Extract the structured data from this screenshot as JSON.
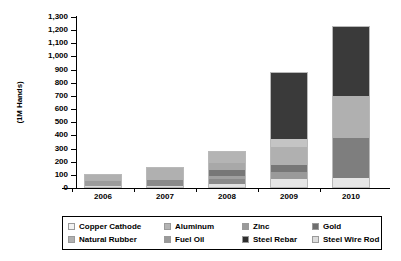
{
  "chart_data": {
    "type": "bar",
    "stacked": true,
    "title": "",
    "subtitle": "",
    "xlabel": "",
    "ylabel": "(1M Hands)",
    "categories": [
      "2006",
      "2007",
      "2008",
      "2009",
      "2010"
    ],
    "ylim": [
      0,
      1300
    ],
    "ytick_values": [
      0,
      100,
      200,
      300,
      400,
      500,
      600,
      700,
      800,
      900,
      1000,
      1100,
      1200,
      1300
    ],
    "ytick_labels": [
      "0",
      "100",
      "200",
      "300",
      "400",
      "500",
      "600",
      "700",
      "800",
      "900",
      "1,000",
      "1,100",
      "1,200",
      "1,300"
    ],
    "grid": false,
    "legend_position": "bottom",
    "series": [
      {
        "name": "Copper Cathode",
        "color": "#f2f2f2",
        "values": [
          8,
          10,
          15,
          25,
          40
        ]
      },
      {
        "name": "Aluminum",
        "color": "#b4b4b4",
        "values": [
          0,
          0,
          20,
          35,
          60
        ]
      },
      {
        "name": "Zinc",
        "color": "#8f8f8f",
        "values": [
          0,
          0,
          15,
          30,
          50
        ]
      },
      {
        "name": "Gold",
        "color": "#6e6e6e",
        "values": [
          0,
          0,
          20,
          40,
          70
        ]
      },
      {
        "name": "Natural Rubber",
        "color": "#9c9c9c",
        "values": [
          0,
          45,
          30,
          70,
          130
        ]
      },
      {
        "name": "Fuel Oil",
        "color": "#a8a8a8",
        "values": [
          0,
          0,
          35,
          80,
          140
        ]
      },
      {
        "name": "Steel Rebar",
        "color": "#3a3a3a",
        "values": [
          0,
          0,
          0,
          300,
          430
        ]
      },
      {
        "name": "Steel Wire Rod",
        "color": "#d0d0d0",
        "values": [
          102,
          105,
          145,
          300,
          310
        ]
      }
    ],
    "totals": [
      110,
      160,
      280,
      880,
      1230
    ],
    "bars": [
      {
        "category": "2006",
        "total": 110,
        "segments": [
          {
            "name": "Steel Wire Rod",
            "value": 8,
            "color": "#dcdcdc"
          },
          {
            "name": "Natural Rubber",
            "value": 45,
            "color": "#9c9c9c"
          },
          {
            "name": "Copper Cathode",
            "value": 57,
            "color": "#b0b0b0"
          }
        ]
      },
      {
        "category": "2007",
        "total": 160,
        "segments": [
          {
            "name": "Steel Wire Rod",
            "value": 10,
            "color": "#dcdcdc"
          },
          {
            "name": "Steel Rebar",
            "value": 45,
            "color": "#8a8a8a"
          },
          {
            "name": "Natural Rubber",
            "value": 105,
            "color": "#b0b0b0"
          }
        ]
      },
      {
        "category": "2008",
        "total": 280,
        "segments": [
          {
            "name": "Steel Wire Rod",
            "value": 20,
            "color": "#e2e2e2"
          },
          {
            "name": "Steel Rebar",
            "value": 40,
            "color": "#8a8a8a"
          },
          {
            "name": "Fuel Oil",
            "value": 30,
            "color": "#a0a0a0"
          },
          {
            "name": "Natural Rubber",
            "value": 45,
            "color": "#777777"
          },
          {
            "name": "Gold",
            "value": 60,
            "color": "#a8a8a8"
          },
          {
            "name": "Aluminum",
            "value": 85,
            "color": "#b4b4b4"
          }
        ]
      },
      {
        "category": "2009",
        "total": 880,
        "segments": [
          {
            "name": "Steel Wire Rod",
            "value": 60,
            "color": "#e6e6e6"
          },
          {
            "name": "Fuel Oil",
            "value": 55,
            "color": "#9a9a9a"
          },
          {
            "name": "Natural Rubber",
            "value": 55,
            "color": "#777777"
          },
          {
            "name": "Gold",
            "value": 140,
            "color": "#b0b0b0"
          },
          {
            "name": "Zinc",
            "value": 60,
            "color": "#c4c4c4"
          },
          {
            "name": "Steel Rebar",
            "value": 510,
            "color": "#3a3a3a"
          }
        ]
      },
      {
        "category": "2010",
        "total": 1230,
        "segments": [
          {
            "name": "Steel Wire Rod",
            "value": 70,
            "color": "#e6e6e6"
          },
          {
            "name": "Fuel Oil",
            "value": 310,
            "color": "#7e7e7e"
          },
          {
            "name": "Natural Rubber",
            "value": 320,
            "color": "#b0b0b0"
          },
          {
            "name": "Steel Rebar",
            "value": 530,
            "color": "#3a3a3a"
          }
        ]
      }
    ],
    "legend": [
      {
        "label": "Copper Cathode",
        "color": "#f2f2f2"
      },
      {
        "label": "Aluminum",
        "color": "#b4b4b4"
      },
      {
        "label": "Zinc",
        "color": "#9a9a9a"
      },
      {
        "label": "Gold",
        "color": "#6e6e6e"
      },
      {
        "label": "Natural Rubber",
        "color": "#b0b0b0"
      },
      {
        "label": "Fuel Oil",
        "color": "#9a9a9a"
      },
      {
        "label": "Steel Rebar",
        "color": "#2e2e2e"
      },
      {
        "label": "Steel Wire Rod",
        "color": "#dcdcdc"
      }
    ]
  }
}
